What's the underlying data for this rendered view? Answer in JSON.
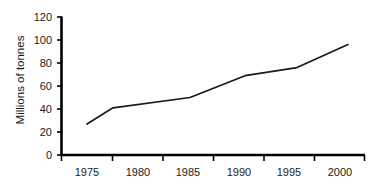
{
  "chart_data": {
    "type": "line",
    "title": "",
    "xlabel": "",
    "ylabel": "Millions of tonnes",
    "x": [
      1975,
      1980,
      1985,
      1990,
      1995,
      2000
    ],
    "categories": [
      "1975",
      "1980",
      "1985",
      "1990",
      "1995",
      "2000"
    ],
    "values": [
      27,
      41,
      50,
      69,
      76,
      96
    ],
    "series": [
      {
        "name": "Millions of tonnes",
        "values": [
          27,
          41,
          50,
          69,
          76,
          96
        ]
      }
    ],
    "xlim": [
      1972.5,
      1002.5
    ],
    "ylim": [
      0,
      120
    ],
    "y_ticks": [
      0,
      20,
      40,
      60,
      80,
      100,
      120
    ],
    "x_ticks": [
      "1975",
      "1980",
      "1985",
      "1990",
      "1995",
      "2000"
    ],
    "grid": false,
    "legend": false,
    "legend_position": "none",
    "line_color": "#1a1a1a",
    "axis_color": "#000000",
    "background_color": "#ffffff"
  },
  "axes": {
    "y_tick_labels": [
      "120",
      "100",
      "80",
      "60",
      "40",
      "20",
      "0"
    ],
    "x_tick_labels": [
      "1975",
      "1980",
      "1985",
      "1990",
      "1995",
      "2000"
    ],
    "y_axis_title": "Millions of tonnes"
  }
}
